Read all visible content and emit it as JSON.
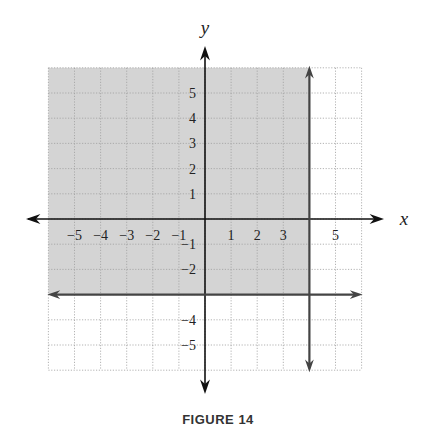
{
  "chart_data": {
    "type": "region",
    "title": "",
    "caption": "FIGURE 14",
    "xlabel": "x",
    "ylabel": "y",
    "xlim": [
      -6,
      6
    ],
    "ylim": [
      -6,
      6
    ],
    "grid": true,
    "x_tick_labels": [
      "-5",
      "-4",
      "-3",
      "-2",
      "-1",
      "1",
      "2",
      "3",
      "5"
    ],
    "x_ticks": [
      -5,
      -4,
      -3,
      -2,
      -1,
      1,
      2,
      3,
      5
    ],
    "y_tick_labels": [
      "5",
      "4",
      "3",
      "2",
      "1",
      "-1",
      "-2",
      "-4",
      "-5"
    ],
    "y_ticks": [
      5,
      4,
      3,
      2,
      1,
      -1,
      -2,
      -4,
      -5
    ],
    "boundary_lines": [
      {
        "equation": "x = 4",
        "orientation": "vertical",
        "value": 4
      },
      {
        "equation": "y = -3",
        "orientation": "horizontal",
        "value": -3
      }
    ],
    "shaded_region": {
      "description": "x <= 4 and y >= -3",
      "x_max": 4,
      "y_min": -3
    },
    "colors": {
      "shade": "#d4d4d4",
      "grid": "#a0a0a0",
      "axis": "#111111",
      "boundary": "#444444"
    }
  }
}
